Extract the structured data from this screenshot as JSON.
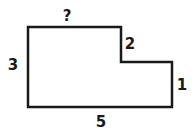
{
  "diagram": {
    "type": "rectilinear-polygon",
    "stroke_color": "#1a1a1a",
    "fill_color": "#ffffff",
    "labels": {
      "top": "?",
      "left": "3",
      "step_vertical": "2",
      "right": "1",
      "bottom": "5"
    },
    "sides": [
      {
        "name": "top",
        "label": "?"
      },
      {
        "name": "step-vertical",
        "label": "2"
      },
      {
        "name": "right",
        "label": "1"
      },
      {
        "name": "bottom",
        "label": "5"
      },
      {
        "name": "left",
        "label": "3"
      }
    ]
  }
}
